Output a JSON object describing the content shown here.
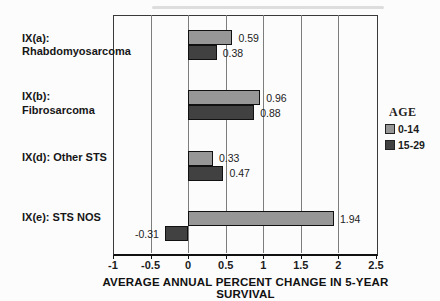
{
  "chart_data": {
    "type": "bar",
    "orientation": "horizontal",
    "xlabel": "AVERAGE ANNUAL PERCENT CHANGE IN 5-YEAR SURVIVAL",
    "xlim": [
      -1,
      2.5
    ],
    "xticks": [
      -1,
      -0.5,
      0,
      0.5,
      1,
      1.5,
      2,
      2.5
    ],
    "xtick_labels": [
      "-1",
      "-0.5",
      "0",
      "0.5",
      "1",
      "1.5",
      "2",
      "2.5"
    ],
    "grid": true,
    "categories": [
      {
        "lines": [
          "IX(a):",
          "Rhabdomyosarcoma"
        ]
      },
      {
        "lines": [
          "IX(b): Fibrosarcoma"
        ]
      },
      {
        "lines": [
          "IX(d): Other STS"
        ]
      },
      {
        "lines": [
          "IX(e): STS NOS"
        ]
      }
    ],
    "series": [
      {
        "name": "0-14",
        "color": "#979797",
        "values": [
          0.59,
          0.96,
          0.33,
          1.94
        ],
        "labels": [
          "0.59",
          "0.96",
          "0.33",
          "1.94"
        ]
      },
      {
        "name": "15-29",
        "color": "#414141",
        "values": [
          0.38,
          0.88,
          0.47,
          -0.31
        ],
        "labels": [
          "0.38",
          "0.88",
          "0.47",
          "-0.31"
        ]
      }
    ],
    "legend": {
      "title": "AGE",
      "position": "right"
    }
  }
}
